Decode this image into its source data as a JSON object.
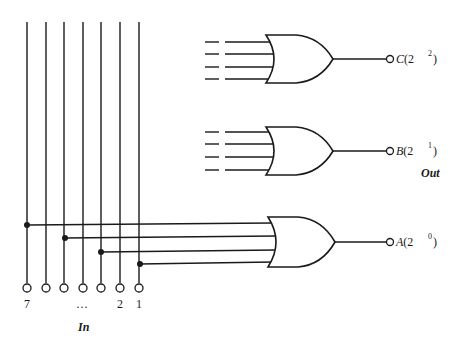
{
  "diagram": {
    "type": "encoder-logic",
    "input_group_label": "In",
    "output_group_label": "Out",
    "input_labels": {
      "left": "7",
      "ellipsis": "…",
      "second": "2",
      "first": "1"
    },
    "input_lines": [
      {
        "id": "7",
        "x": 27
      },
      {
        "id": "6",
        "x": 46
      },
      {
        "id": "5",
        "x": 64
      },
      {
        "id": "4",
        "x": 83
      },
      {
        "id": "3",
        "x": 101
      },
      {
        "id": "2",
        "x": 120
      },
      {
        "id": "1",
        "x": 139
      }
    ],
    "gates": [
      {
        "name": "C",
        "kind": "OR",
        "output_label": "C(2",
        "exponent": "2",
        "close": ")",
        "inputs_shown": "dashed"
      },
      {
        "name": "B",
        "kind": "OR",
        "output_label": "B(2",
        "exponent": "1",
        "close": ")",
        "inputs_shown": "dashed"
      },
      {
        "name": "A",
        "kind": "OR",
        "output_label": "A(2",
        "exponent": "0",
        "close": ")",
        "inputs_from": [
          "7",
          "5",
          "3",
          "1"
        ]
      }
    ],
    "colors": {
      "ink": "#1a1a1a",
      "background": "#ffffff"
    }
  }
}
